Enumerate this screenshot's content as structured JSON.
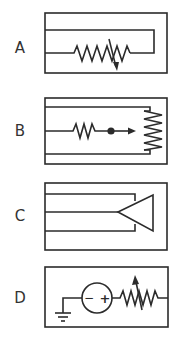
{
  "options": [
    {
      "label": "A",
      "description": "variable resistor (rheostat) with arrow through zigzag in rectangular loop"
    },
    {
      "label": "B",
      "description": "resistor in series with dot and arrow pointing to spring/zigzag element"
    },
    {
      "label": "C",
      "description": "triangle connected to three parallel lines"
    },
    {
      "label": "D",
      "description": "ground, DC source with minus and plus, variable resistor"
    }
  ],
  "source_symbols": {
    "minus": "−",
    "plus": "+"
  },
  "colors": {
    "stroke": "#2b2b2b",
    "background": "#ffffff",
    "label": "#333333"
  }
}
